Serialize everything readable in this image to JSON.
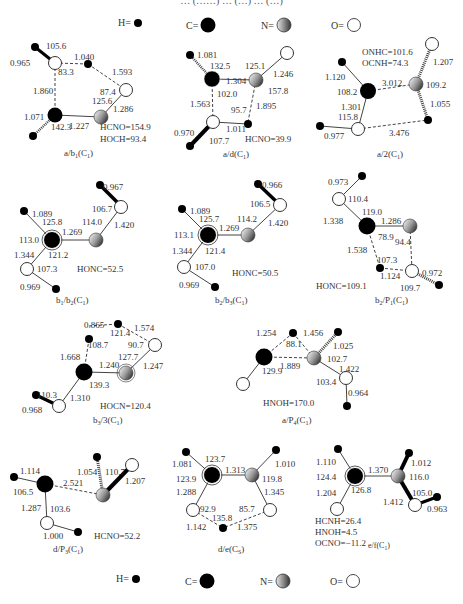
{
  "figure": {
    "caption_top_partial": "… (……) … (…) … (…)",
    "legend_top": [
      {
        "label": "H=",
        "atom": "H",
        "color": "#000000",
        "style": "small-black"
      },
      {
        "label": "C=",
        "atom": "C",
        "color": "#000000",
        "style": "large-black"
      },
      {
        "label": "N=",
        "atom": "N",
        "color": "#8a8a8a",
        "style": "gradient-gray"
      },
      {
        "label": "O=",
        "atom": "O",
        "color": "#ffffff",
        "style": "hollow"
      }
    ],
    "legend_bottom": [
      {
        "label": "H=",
        "atom": "H"
      },
      {
        "label": "C=",
        "atom": "C"
      },
      {
        "label": "N=",
        "atom": "N"
      },
      {
        "label": "O=",
        "atom": "O"
      }
    ],
    "structures": [
      {
        "id": "a_b1",
        "label": "a/b",
        "label_sub": "1",
        "symmetry": "(C",
        "symmetry_sub": "1",
        "symmetry_close": ")",
        "values": [
          "105.6",
          "1.040",
          "0.965",
          "83.3",
          "1.593",
          "1.860",
          "87.4",
          "125.6",
          "1.286",
          "1.071",
          "1.227",
          "142.3"
        ],
        "dihedrals": [
          "HCNO=154.9",
          "HOCH=93.4"
        ]
      },
      {
        "id": "a_d",
        "label": "a/d",
        "label_sub": "",
        "symmetry": "(C",
        "symmetry_sub": "1",
        "symmetry_close": ")",
        "values": [
          "1.081",
          "132.5",
          "1.304",
          "125.1",
          "1.246",
          "102.0",
          "157.8",
          "1.563",
          "95.7",
          "1.895",
          "1.011",
          "0.970",
          "107.7"
        ],
        "dihedrals": [
          "HCNO=39.9"
        ]
      },
      {
        "id": "a_2",
        "label": "a/2",
        "label_sub": "",
        "symmetry": "(C",
        "symmetry_sub": "1",
        "symmetry_close": ")",
        "values": [
          "1.207",
          "1.120",
          "3.012",
          "109.2",
          "108.2",
          "1.301",
          "1.055",
          "115.8",
          "0.977",
          "3.476"
        ],
        "dihedrals": [
          "ONHC=101.6",
          "OCNH=74.3"
        ]
      },
      {
        "id": "b1_b2",
        "label": "b",
        "label_sub": "1",
        "label_mid": "/b",
        "label_sub2": "2",
        "symmetry": "(C",
        "symmetry_sub": "1",
        "symmetry_close": ")",
        "values": [
          "0.967",
          "1.089",
          "106.7",
          "125.8",
          "114.0",
          "1.420",
          "113.0",
          "1.269",
          "1.344",
          "121.2",
          "107.3",
          "0.969"
        ],
        "dihedrals": [
          "HONC=52.5"
        ]
      },
      {
        "id": "b2_b3",
        "label": "b",
        "label_sub": "2",
        "label_mid": "/b",
        "label_sub2": "3",
        "symmetry": "(C",
        "symmetry_sub": "1",
        "symmetry_close": ")",
        "values": [
          "0.966",
          "1.089",
          "106.5",
          "125.7",
          "114.2",
          "1.420",
          "113.1",
          "1.269",
          "1.344",
          "121.4",
          "107.0",
          "0.969"
        ],
        "dihedrals": [
          "HONC=50.5"
        ]
      },
      {
        "id": "b2_P1",
        "label": "b",
        "label_sub": "2",
        "label_mid": "/P",
        "label_sub2": "1",
        "symmetry": "(C",
        "symmetry_sub": "1",
        "symmetry_close": ")",
        "values": [
          "0.973",
          "110.4",
          "119.0",
          "1.338",
          "1.286",
          "78.9",
          "94.4",
          "1.538",
          "107.3",
          "0.972",
          "1.124",
          "109.7"
        ],
        "dihedrals": [
          "HONC=109.1"
        ]
      },
      {
        "id": "b3_3",
        "label": "b",
        "label_sub": "3",
        "label_mid": "/3",
        "label_sub2": "",
        "symmetry": "(C",
        "symmetry_sub": "1",
        "symmetry_close": ")",
        "values": [
          "0.865",
          "121.4",
          "1.574",
          "108.7",
          "90.7",
          "1.668",
          "127.7",
          "1.240",
          "1.247",
          "139.3",
          "110.3",
          "1.310",
          "0.968"
        ],
        "dihedrals": [
          "HOCN=120.4"
        ]
      },
      {
        "id": "a_P4",
        "label": "a/P",
        "label_sub": "4",
        "symmetry": "(C",
        "symmetry_sub": "1",
        "symmetry_close": ")",
        "values": [
          "1.254",
          "1.456",
          "88.1",
          "1.025",
          "102.7",
          "1.889",
          "1.422",
          "129.9",
          "103.4",
          "0.964"
        ],
        "dihedrals": [
          "HNOH=170.0"
        ]
      },
      {
        "id": "d_P3",
        "label": "d/P",
        "label_sub": "3",
        "symmetry": "(C",
        "symmetry_sub": "1",
        "symmetry_close": ")",
        "values": [
          "1.114",
          "1.054",
          "110.7",
          "2.521",
          "1.207",
          "106.5",
          "1.287",
          "103.6",
          "1.000"
        ],
        "dihedrals": [
          "HCNO=52.2"
        ]
      },
      {
        "id": "d_e",
        "label": "d/e",
        "label_sub": "",
        "symmetry": "(C",
        "symmetry_sub": "S",
        "symmetry_close": ")",
        "values": [
          "1.081",
          "123.7",
          "1.010",
          "1.313",
          "123.9",
          "119.8",
          "1.288",
          "1.345",
          "92.9",
          "85.7",
          "135.8",
          "1.142",
          "1.375"
        ],
        "dihedrals": []
      },
      {
        "id": "e_f",
        "label": "e/f",
        "label_sub": "",
        "symmetry": "(C",
        "symmetry_sub": "1",
        "symmetry_close": ")",
        "values": [
          "1.110",
          "1.370",
          "1.012",
          "124.4",
          "116.0",
          "126.8",
          "105.0",
          "1.204",
          "1.412",
          "0.963"
        ],
        "dihedrals": [
          "HCNH=26.4",
          "HNOH=4.5",
          "OCNO=−11.2"
        ]
      }
    ]
  }
}
